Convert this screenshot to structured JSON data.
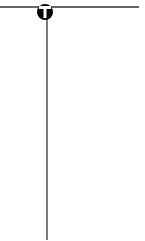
{
  "diagram": {
    "type": "line-junction",
    "colors": {
      "background": "#ffffff",
      "line": "#333333",
      "node_fill": "#000000",
      "node_glyph": "#ffffff"
    },
    "horizontal_line": {
      "x1": 0,
      "x2": 139,
      "y": 7
    },
    "vertical_line": {
      "x": 47,
      "y1": 18,
      "y2": 240
    },
    "node": {
      "cx": 45,
      "cy": 12,
      "r": 8,
      "glyph": "T",
      "icon": "t-junction-icon"
    }
  }
}
